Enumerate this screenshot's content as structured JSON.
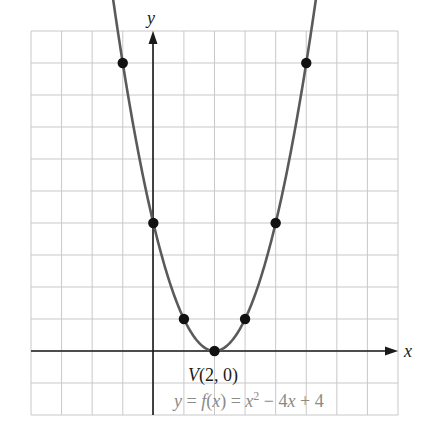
{
  "chart_data": {
    "type": "line",
    "title": "",
    "xlabel": "x",
    "ylabel": "y",
    "xlim": [
      -4,
      8
    ],
    "ylim": [
      -2,
      10
    ],
    "grid": true,
    "series": [
      {
        "name": "y = f(x) = x^2 - 4x + 4",
        "function": "x^2 - 4x + 4",
        "points": [
          {
            "x": -1,
            "y": 9
          },
          {
            "x": 0,
            "y": 4
          },
          {
            "x": 1,
            "y": 1
          },
          {
            "x": 2,
            "y": 0
          },
          {
            "x": 3,
            "y": 1
          },
          {
            "x": 4,
            "y": 4
          },
          {
            "x": 5,
            "y": 9
          }
        ]
      }
    ],
    "annotations": [
      {
        "text": "V(2, 0)",
        "x": 2,
        "y": 0
      },
      {
        "text": "y = f(x) = x² − 4x + 4"
      }
    ]
  },
  "labels": {
    "x_axis": "x",
    "y_axis": "y",
    "vertex": "V(2, 0)",
    "equation_prefix": "y = f(x) = x",
    "equation_exp": "2",
    "equation_suffix": " − 4x + 4"
  },
  "colors": {
    "grid": "#c8c8c8",
    "axis": "#1a1a1a",
    "curve": "#5a5a5a",
    "points": "#111111",
    "equation": "#8a8a8a"
  }
}
